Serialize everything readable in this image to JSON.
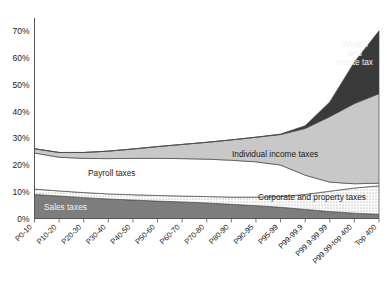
{
  "chart_data": {
    "type": "area",
    "title": "",
    "subtitle": "",
    "xlabel": "",
    "ylabel": "",
    "stacked": true,
    "grid": false,
    "legend_position": "inline-annotations",
    "ylim": [
      0,
      75
    ],
    "ytick_values": [
      0,
      10,
      20,
      30,
      40,
      50,
      60,
      70
    ],
    "ytick_labels": [
      "0%",
      "10%",
      "20%",
      "30%",
      "40%",
      "50%",
      "60%",
      "70%"
    ],
    "categories": [
      "P0-10",
      "P10-20",
      "P20-30",
      "P30-40",
      "P40-50",
      "P50-60",
      "P60-70",
      "P70-80",
      "P80-90",
      "P90-95",
      "P95-99",
      "P99-99.9",
      "P99.9-99.99",
      "P99.99-top 400",
      "Top 400"
    ],
    "series": [
      {
        "name": "Sales taxes",
        "fill": "#7d7d7d",
        "pattern": "solid",
        "values": [
          9.0,
          8.4,
          7.8,
          7.3,
          6.9,
          6.5,
          6.2,
          5.8,
          5.3,
          4.8,
          4.2,
          3.4,
          2.6,
          2.0,
          1.6
        ]
      },
      {
        "name": "Corporate and property taxes",
        "fill": "#ffffff",
        "pattern": "dots",
        "values": [
          2.0,
          1.9,
          1.9,
          1.9,
          2.0,
          2.1,
          2.2,
          2.4,
          2.7,
          3.2,
          4.0,
          5.6,
          7.6,
          9.4,
          10.6
        ]
      },
      {
        "name": "Payroll taxes",
        "fill": "#ffffff",
        "pattern": "solid",
        "values": [
          13.5,
          12.6,
          12.8,
          13.2,
          13.6,
          13.9,
          14.0,
          14.0,
          13.8,
          13.2,
          11.8,
          7.2,
          3.4,
          1.6,
          1.0
        ]
      },
      {
        "name": "Individual income taxes",
        "fill": "#c8c8c8",
        "pattern": "solid",
        "values": [
          1.6,
          1.8,
          2.2,
          2.8,
          3.5,
          4.4,
          5.3,
          6.3,
          7.6,
          9.2,
          11.4,
          17.5,
          24.5,
          30.0,
          33.5
        ]
      },
      {
        "name": "Wealth and estate tax",
        "fill": "#3a3a3a",
        "pattern": "solid",
        "values": [
          0.0,
          0.0,
          0.0,
          0.0,
          0.0,
          0.0,
          0.0,
          0.0,
          0.0,
          0.0,
          0.2,
          1.0,
          5.5,
          15.5,
          23.5
        ]
      }
    ],
    "annotations": [
      {
        "text": "Wealth",
        "x": 355,
        "y": 47,
        "color": "light"
      },
      {
        "text": "and",
        "x": 355,
        "y": 56,
        "color": "light"
      },
      {
        "text": "estate tax",
        "x": 355,
        "y": 65,
        "color": "light"
      },
      {
        "text": "Individual income taxes",
        "x": 232,
        "y": 157,
        "color": "dark"
      },
      {
        "text": "Payroll taxes",
        "x": 88,
        "y": 176,
        "color": "dark"
      },
      {
        "text": "Corporate and property taxes",
        "x": 258,
        "y": 200,
        "color": "dark"
      },
      {
        "text": "Sales taxes",
        "x": 44,
        "y": 210,
        "color": "light"
      }
    ]
  }
}
